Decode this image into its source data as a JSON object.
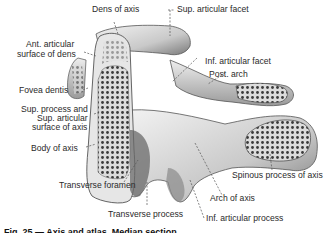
{
  "figure": {
    "labels": {
      "dens_of_axis": "Dens of axis",
      "sup_articular_facet": "Sup. articular facet",
      "ant_articular_surface_line1": "Ant. articular",
      "ant_articular_surface_line2": "surface of dens",
      "inf_articular_facet": "Inf. articular facet",
      "post_arch": "Post. arch",
      "fovea_dentis": "Fovea dentis",
      "sup_process_line1": "Sup. process and",
      "sup_process_line2": "Sup. articular",
      "sup_process_line3": "surface of axis",
      "body_of_axis": "Body of axis",
      "transverse_foramen": "Transverse foramen",
      "spinous_process": "Spinous process of axis",
      "arch_of_axis": "Arch of axis",
      "transverse_process": "Transverse process",
      "inf_articular_process": "Inf. articular process"
    },
    "caption": "Fig. 25 — Axis and atlas. Median section"
  },
  "colors": {
    "bone_light": "#e9e9e9",
    "bone_mid": "#bdbdbd",
    "bone_dark": "#555555",
    "label_text": "#2a2a2a",
    "leader_line": "#555555"
  }
}
